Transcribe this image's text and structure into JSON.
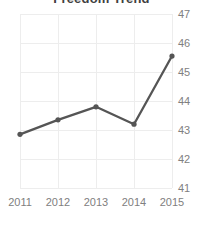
{
  "chart_data": {
    "type": "line",
    "title": "Freedom Trend",
    "subtitle": "",
    "xlabel": "",
    "ylabel": "",
    "categories": [
      "2011",
      "2012",
      "2013",
      "2014",
      "2015"
    ],
    "x": [
      2011,
      2012,
      2013,
      2014,
      2015
    ],
    "values": [
      42.85,
      43.35,
      43.8,
      43.2,
      45.55
    ],
    "series": [
      {
        "name": "Freedom Trend",
        "values": [
          42.85,
          43.35,
          43.8,
          43.2,
          45.55
        ]
      }
    ],
    "ylim": [
      41,
      47
    ],
    "xlim": [
      2011,
      2015
    ],
    "yticks": [
      41,
      42,
      43,
      44,
      45,
      46,
      47
    ],
    "ytick_labels": [
      "41",
      "42",
      "43",
      "44",
      "45",
      "46",
      "47"
    ],
    "xticks": [
      2011,
      2012,
      2013,
      2014,
      2015
    ],
    "xtick_labels": [
      "2011",
      "2012",
      "2013",
      "2014",
      "2015"
    ],
    "y_axis_position": "right",
    "grid": true,
    "grid_axis": "both",
    "legend": false,
    "legend_position": "none",
    "markers": true,
    "annotations": [],
    "colors": {
      "line": "#555555",
      "marker": "#555555",
      "grid": "#ededed",
      "tick_label": "#808080",
      "title": "#404040",
      "background": "#ffffff"
    }
  }
}
